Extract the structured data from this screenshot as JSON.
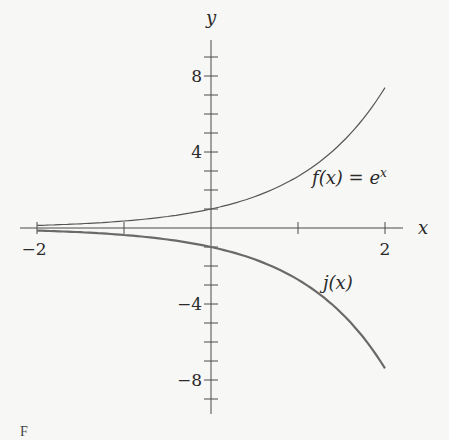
{
  "chart_data": {
    "type": "line",
    "title": "",
    "xlabel": "x",
    "ylabel": "y",
    "xlim": [
      -2.2,
      2.2
    ],
    "ylim": [
      -9.5,
      9.5
    ],
    "grid": false,
    "x_tick_values": [
      -2,
      -1,
      1,
      2
    ],
    "x_tick_labels": [
      {
        "value": -2,
        "label": "−2"
      },
      {
        "value": 2,
        "label": "2"
      }
    ],
    "y_tick_values": [
      -9,
      -8,
      -7,
      -6,
      -5,
      -4,
      -3,
      -2,
      -1,
      1,
      2,
      3,
      4,
      5,
      6,
      7,
      8,
      9
    ],
    "y_tick_labels": [
      {
        "value": 8,
        "label": "8"
      },
      {
        "value": 4,
        "label": "4"
      },
      {
        "value": -4,
        "label": "−4"
      },
      {
        "value": -8,
        "label": "−8"
      }
    ],
    "series": [
      {
        "name": "f(x) = e^x",
        "label_text": "f(x) = e",
        "label_sup": "x",
        "color": "#555555",
        "stroke_width": 1.2,
        "x": [
          -2,
          -1.5,
          -1,
          -0.5,
          0,
          0.5,
          1,
          1.25,
          1.5,
          1.75,
          2
        ],
        "y": [
          0.135,
          0.223,
          0.368,
          0.607,
          1,
          1.649,
          2.718,
          3.49,
          4.482,
          5.755,
          7.389
        ]
      },
      {
        "name": "j(x)",
        "label_text": "j(x)",
        "color": "#6a6a6a",
        "stroke_width": 2.2,
        "x": [
          -2,
          -1.5,
          -1,
          -0.5,
          0,
          0.5,
          1,
          1.25,
          1.5,
          1.75,
          2
        ],
        "y": [
          -0.135,
          -0.223,
          -0.368,
          -0.607,
          -1,
          -1.649,
          -2.718,
          -3.49,
          -4.482,
          -5.755,
          -7.389
        ]
      }
    ],
    "annotations": [
      {
        "text": "f(x) = e^x",
        "near": [
          1.6,
          2.6
        ]
      },
      {
        "text": "j(x)",
        "near": [
          1.4,
          -2.7
        ]
      }
    ]
  },
  "caption": "F"
}
